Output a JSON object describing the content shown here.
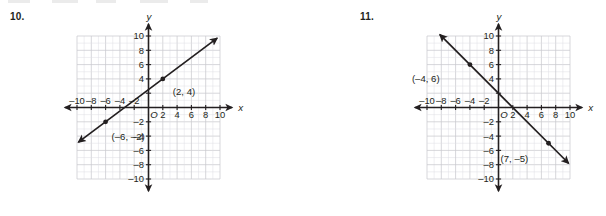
{
  "page": {
    "background": "#ffffff",
    "ink": "#231f20",
    "grid_color": "#c9c9cf",
    "grid_minor_color": "#dedee4"
  },
  "problems": [
    {
      "number": "10.",
      "name": "problem-10",
      "chart_data": {
        "type": "line",
        "title": "",
        "xlabel": "x",
        "ylabel": "y",
        "xlim": [
          -11,
          11
        ],
        "ylim": [
          -11,
          11
        ],
        "grid": true,
        "grid_step": 1,
        "tick_step": 2,
        "xticks": [
          -10,
          -8,
          -6,
          -4,
          -2,
          2,
          4,
          6,
          8,
          10
        ],
        "yticks": [
          10,
          8,
          6,
          4,
          -2,
          -4,
          -6,
          -8,
          -10
        ],
        "xtick_labels": [
          "–10",
          "–8",
          "–6",
          "–4",
          "–2",
          "2",
          "4",
          "6",
          "8",
          "10"
        ],
        "ytick_labels": [
          "10",
          "8",
          "6",
          "4",
          "–2",
          "–4",
          "–6",
          "–8",
          "–10"
        ],
        "origin_label": "O",
        "x_axis_label": "x",
        "y_axis_label": "y",
        "series": [
          {
            "name": "line",
            "kind": "line",
            "slope": 0.75,
            "intercept": 2.5,
            "x_from": -9.8,
            "x_to": 9.6,
            "arrows": "both"
          }
        ],
        "points": [
          {
            "x": 2,
            "y": 4,
            "label": "(2, 4)",
            "label_dx": 10,
            "label_dy": 16
          },
          {
            "x": -6,
            "y": -2,
            "label": "(–6, –2)",
            "label_dx": 6,
            "label_dy": 18
          }
        ]
      }
    },
    {
      "number": "11.",
      "name": "problem-11",
      "chart_data": {
        "type": "line",
        "title": "",
        "xlabel": "x",
        "ylabel": "y",
        "xlim": [
          -11,
          11
        ],
        "ylim": [
          -11,
          11
        ],
        "grid": true,
        "grid_step": 1,
        "tick_step": 2,
        "xticks": [
          -10,
          -8,
          -6,
          -4,
          -2,
          2,
          4,
          6,
          8,
          10
        ],
        "yticks": [
          10,
          8,
          6,
          4,
          -2,
          -4,
          -6,
          -8,
          -10
        ],
        "xtick_labels": [
          "–10",
          "–8",
          "–6",
          "–4",
          "–2",
          "2",
          "4",
          "6",
          "8",
          "10"
        ],
        "ytick_labels": [
          "10",
          "8",
          "6",
          "4",
          "–2",
          "–4",
          "–6",
          "–8",
          "–10"
        ],
        "origin_label": "O",
        "x_axis_label": "x",
        "y_axis_label": "y",
        "series": [
          {
            "name": "line",
            "kind": "line",
            "slope": -1,
            "intercept": 2,
            "x_from": -8.2,
            "x_to": 9.8,
            "arrows": "both"
          }
        ],
        "points": [
          {
            "x": -4,
            "y": 6,
            "label": "(–4, 6)",
            "label_dx": -58,
            "label_dy": 17
          },
          {
            "x": 7,
            "y": -5,
            "label": "(7, –5)",
            "label_dx": -48,
            "label_dy": 19
          }
        ]
      }
    }
  ]
}
